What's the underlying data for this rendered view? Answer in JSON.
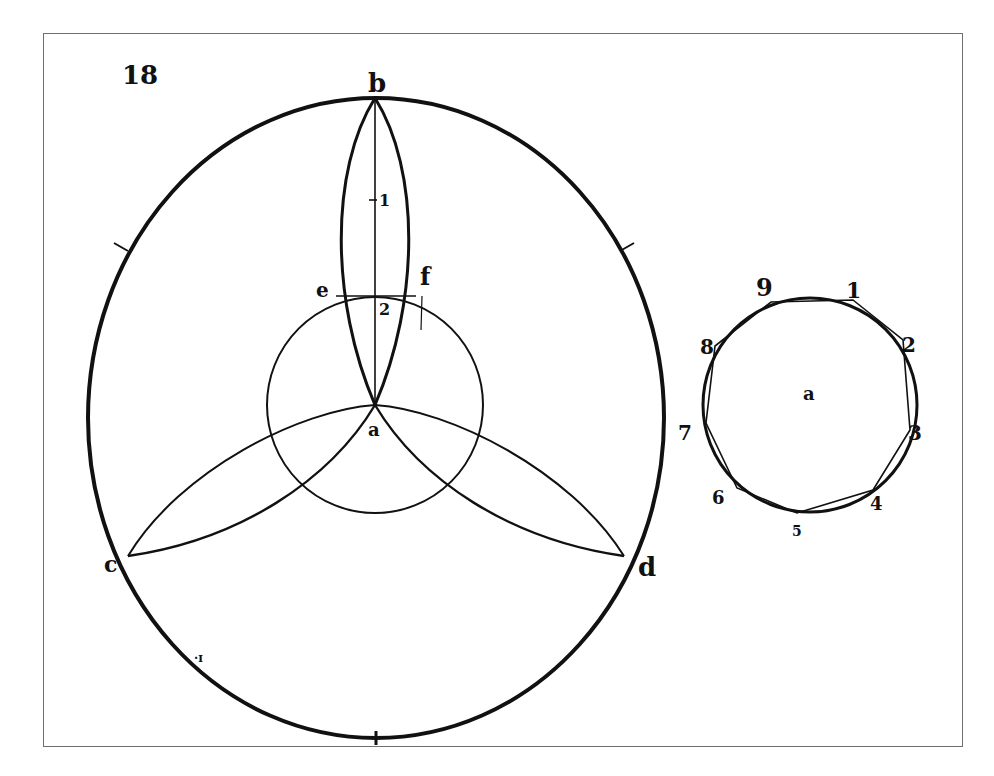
{
  "figure": {
    "number": "18",
    "stroke_color": "#111111",
    "frame_color": "#6f6f6f",
    "background": "#ffffff"
  },
  "large_figure": {
    "labels": {
      "top": "b",
      "left": "c",
      "right": "d",
      "center": "a",
      "chord_left": "e",
      "chord_right": "f",
      "axis_mark_1": "1",
      "axis_mark_2": "2",
      "bottom_left_mark": "·ɪ"
    }
  },
  "nonagon_figure": {
    "center_label": "a",
    "vertex_labels": [
      "1",
      "2",
      "3",
      "4",
      "5",
      "6",
      "7",
      "8",
      "9"
    ]
  }
}
